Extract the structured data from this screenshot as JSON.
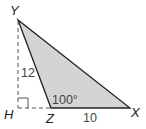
{
  "figure": {
    "vertices": {
      "Y": {
        "label": "Y",
        "x": 18,
        "y": 20
      },
      "H": {
        "label": "H",
        "x": 18,
        "y": 108
      },
      "Z": {
        "label": "Z",
        "x": 51,
        "y": 108
      },
      "X": {
        "label": "X",
        "x": 130,
        "y": 108
      }
    },
    "measures": {
      "height_YH": "12",
      "base_ZX": "10",
      "angle_Z": "100°"
    },
    "colors": {
      "fill": "#d4d4d4",
      "stroke": "#222222",
      "dashed": "#555555"
    }
  }
}
